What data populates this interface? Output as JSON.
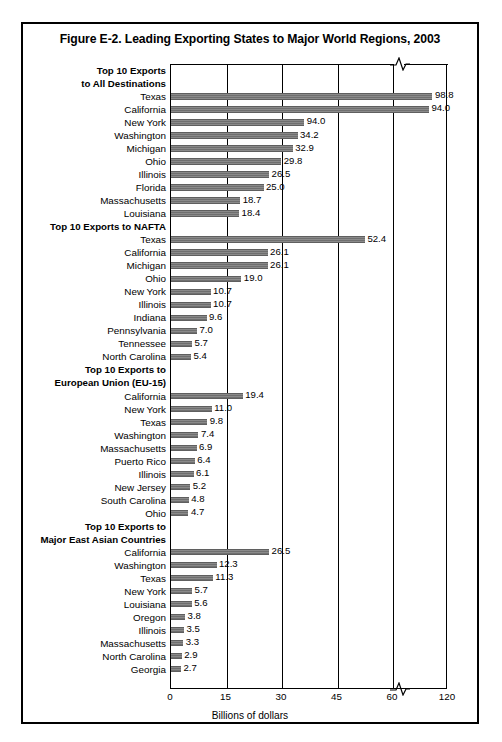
{
  "figure": {
    "title": "Figure E-2. Leading Exporting States to Major World Regions, 2003",
    "xaxis_title": "Billions of dollars"
  },
  "chart_data": {
    "type": "bar",
    "orientation": "horizontal",
    "title": "Figure E-2. Leading Exporting States to Major World Regions, 2003",
    "xlabel": "Billions of dollars",
    "ylabel": "",
    "xlim": [
      0,
      120
    ],
    "xticks": [
      0,
      15,
      30,
      45,
      60,
      120
    ],
    "axis_break": {
      "after": 60,
      "before": 120,
      "note": "broken axis between 60 and 120"
    },
    "grid": "vertical",
    "legend": "none",
    "bar_color": "#7a7a7a",
    "groups": [
      {
        "label_lines": [
          "Top 10 Exports",
          "to All Destinations"
        ],
        "categories": [
          "Texas",
          "California",
          "New York",
          "Washington",
          "Michigan",
          "Ohio",
          "Illinois",
          "Florida",
          "Massachusetts",
          "Louisiana"
        ],
        "values": [
          98.8,
          94.0,
          36.0,
          34.2,
          32.9,
          29.8,
          26.5,
          25.0,
          18.7,
          18.4
        ],
        "labels": [
          "98.8",
          "94.0",
          "94.0",
          "34.2",
          "32.9",
          "29.8",
          "26.5",
          "25.0",
          "18.7",
          "18.4"
        ]
      },
      {
        "label_lines": [
          "Top 10 Exports to NAFTA"
        ],
        "categories": [
          "Texas",
          "California",
          "Michigan",
          "Ohio",
          "New York",
          "Illinois",
          "Indiana",
          "Pennsylvania",
          "Tennessee",
          "North Carolina"
        ],
        "values": [
          52.4,
          26.1,
          26.1,
          19.0,
          10.7,
          10.7,
          9.6,
          7.0,
          5.7,
          5.4
        ],
        "labels": [
          "52.4",
          "26.1",
          "26.1",
          "19.0",
          "10.7",
          "10.7",
          "9.6",
          "7.0",
          "5.7",
          "5.4"
        ]
      },
      {
        "label_lines": [
          "Top 10 Exports to",
          "European Union (EU-15)"
        ],
        "categories": [
          "California",
          "New York",
          "Texas",
          "Washington",
          "Massachusetts",
          "Puerto Rico",
          "Illinois",
          "New Jersey",
          "South Carolina",
          "Ohio"
        ],
        "values": [
          19.4,
          11.0,
          9.8,
          7.4,
          6.9,
          6.4,
          6.1,
          5.2,
          4.8,
          4.7
        ],
        "labels": [
          "19.4",
          "11.0",
          "9.8",
          "7.4",
          "6.9",
          "6.4",
          "6.1",
          "5.2",
          "4.8",
          "4.7"
        ]
      },
      {
        "label_lines": [
          "Top 10 Exports to",
          "Major East Asian Countries"
        ],
        "categories": [
          "California",
          "Washington",
          "Texas",
          "New York",
          "Louisiana",
          "Oregon",
          "Illinois",
          "Massachusetts",
          "North Carolina",
          "Georgia"
        ],
        "values": [
          26.5,
          12.3,
          11.3,
          5.7,
          5.6,
          3.8,
          3.5,
          3.3,
          2.9,
          2.7
        ],
        "labels": [
          "26.5",
          "12.3",
          "11.3",
          "5.7",
          "5.6",
          "3.8",
          "3.5",
          "3.3",
          "2.9",
          "2.7"
        ]
      }
    ]
  }
}
